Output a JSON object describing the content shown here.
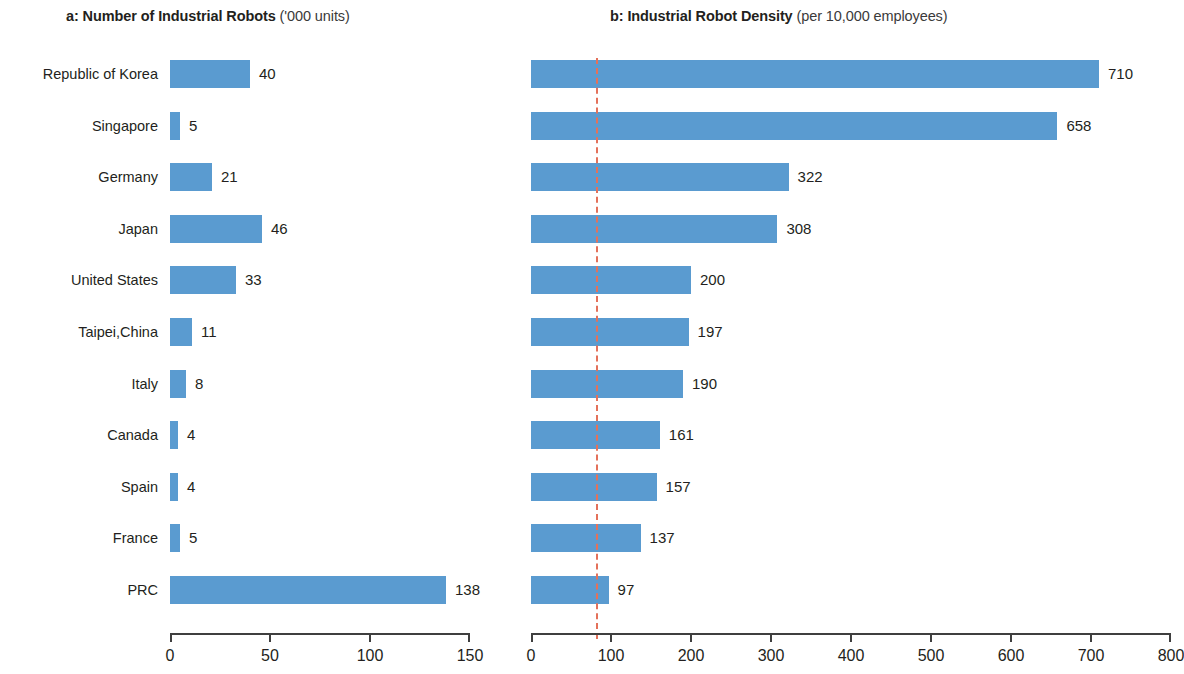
{
  "panels": {
    "a": {
      "label": "a:",
      "title_strong": "a: Number of Industrial Robots",
      "title_paren": "('000 units)",
      "axis": {
        "min": 0,
        "max": 150,
        "ticks": [
          "0",
          "50",
          "100",
          "150"
        ],
        "tick_values": [
          0,
          50,
          100,
          150
        ]
      }
    },
    "b": {
      "label": "b:",
      "title_strong": "b: Industrial Robot Density",
      "title_paren": "(per 10,000 employees)",
      "axis": {
        "min": 0,
        "max": 800,
        "ticks": [
          "0",
          "100",
          "200",
          "300",
          "400",
          "500",
          "600",
          "700",
          "800"
        ],
        "tick_values": [
          0,
          100,
          200,
          300,
          400,
          500,
          600,
          700,
          800
        ]
      },
      "reference_line": {
        "value": 81,
        "color": "#e4715a",
        "style": "dashed"
      }
    }
  },
  "colors": {
    "bar": "#5a9bd0",
    "axis": "#3f3f3f",
    "text": "#231f20",
    "reference_line": "#e4715a"
  },
  "categories": [
    "Republic of Korea",
    "Singapore",
    "Germany",
    "Japan",
    "United States",
    "Taipei,China",
    "Italy",
    "Canada",
    "Spain",
    "France",
    "PRC"
  ],
  "chart_data": [
    {
      "type": "bar",
      "orientation": "horizontal",
      "title": "a: Number of Industrial Robots ('000 units)",
      "xlabel": "",
      "ylabel": "",
      "xlim": [
        0,
        150
      ],
      "grid": false,
      "legend": "none",
      "categories": [
        "Republic of Korea",
        "Singapore",
        "Germany",
        "Japan",
        "United States",
        "Taipei,China",
        "Italy",
        "Canada",
        "Spain",
        "France",
        "PRC"
      ],
      "values": [
        40,
        5,
        21,
        46,
        33,
        11,
        8,
        4,
        4,
        5,
        138
      ],
      "value_labels": [
        "40",
        "5",
        "21",
        "46",
        "33",
        "11",
        "8",
        "4",
        "4",
        "5",
        "138"
      ],
      "xticks": [
        0,
        50,
        100,
        150
      ],
      "xticklabels": [
        "0",
        "50",
        "100",
        "150"
      ]
    },
    {
      "type": "bar",
      "orientation": "horizontal",
      "title": "b: Industrial Robot Density (per 10,000 employees)",
      "xlabel": "",
      "ylabel": "",
      "xlim": [
        0,
        800
      ],
      "grid": false,
      "legend": "none",
      "categories": [
        "Republic of Korea",
        "Singapore",
        "Germany",
        "Japan",
        "United States",
        "Taipei,China",
        "Italy",
        "Canada",
        "Spain",
        "France",
        "PRC"
      ],
      "values": [
        710,
        658,
        322,
        308,
        200,
        197,
        190,
        161,
        157,
        137,
        97
      ],
      "value_labels": [
        "710",
        "658",
        "322",
        "308",
        "200",
        "197",
        "190",
        "161",
        "157",
        "137",
        "97"
      ],
      "xticks": [
        0,
        100,
        200,
        300,
        400,
        500,
        600,
        700,
        800
      ],
      "xticklabels": [
        "0",
        "100",
        "200",
        "300",
        "400",
        "500",
        "600",
        "700",
        "800"
      ],
      "annotations": [
        {
          "kind": "vertical-dashed-line",
          "value": 81,
          "color": "#e4715a"
        }
      ]
    }
  ]
}
